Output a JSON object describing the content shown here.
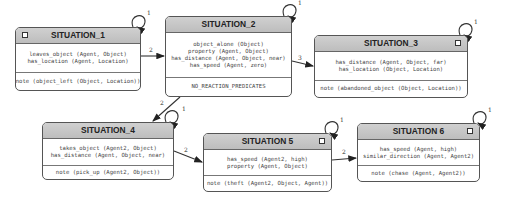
{
  "states": [
    {
      "id": "s1",
      "title": "SITUATION_1",
      "predicates": [
        "leaves_object (Agent, Object)",
        "has_location (Agent, Location)"
      ],
      "note": "note (object_left (Object, Location))",
      "self_loop_label": "1"
    },
    {
      "id": "s2",
      "title": "SITUATION_2",
      "predicates": [
        "object_alone (Object)",
        "property (Agent, Object)",
        "has_distance (Agent, Object, near)",
        "has_speed (Agent, zero)"
      ],
      "note": "NO_REACTION_PREDICATES",
      "self_loop_label": "1"
    },
    {
      "id": "s3",
      "title": "SITUATION_3",
      "predicates": [
        "has_distance (Agent, Object, far)",
        "has_location (Object, Location)"
      ],
      "note": "note (abandoned_object (Object, Location))",
      "self_loop_label": "1"
    },
    {
      "id": "s4",
      "title": "SITUATION_4",
      "predicates": [
        "takes_object (Agent2, Object)",
        "has_distance (Agent, Object, near)"
      ],
      "note": "note (pick_up (Agent2, Object))",
      "self_loop_label": "1"
    },
    {
      "id": "s5",
      "title": "SITUATION 5",
      "predicates": [
        "has_speed (Agent2, high)",
        "property (Agent, Object)"
      ],
      "note": "note (theft (Agent2, Object, Agent))",
      "self_loop_label": "1"
    },
    {
      "id": "s6",
      "title": "SITUATION 6",
      "predicates": [
        "has_speed (Agent, high)",
        "similar_direction (Agent, Agent2)"
      ],
      "note": "note (chase (Agent, Agent2))",
      "self_loop_label": "1"
    }
  ],
  "transitions": [
    {
      "from": "SITUATION_1",
      "to": "SITUATION_2",
      "label": "2"
    },
    {
      "from": "SITUATION_2",
      "to": "SITUATION_3",
      "label": "3"
    },
    {
      "from": "SITUATION_2",
      "to": "SITUATION_4",
      "label": "2"
    },
    {
      "from": "SITUATION_4",
      "to": "SITUATION 5",
      "label": "2"
    },
    {
      "from": "SITUATION 5",
      "to": "SITUATION 6",
      "label": "2"
    }
  ]
}
